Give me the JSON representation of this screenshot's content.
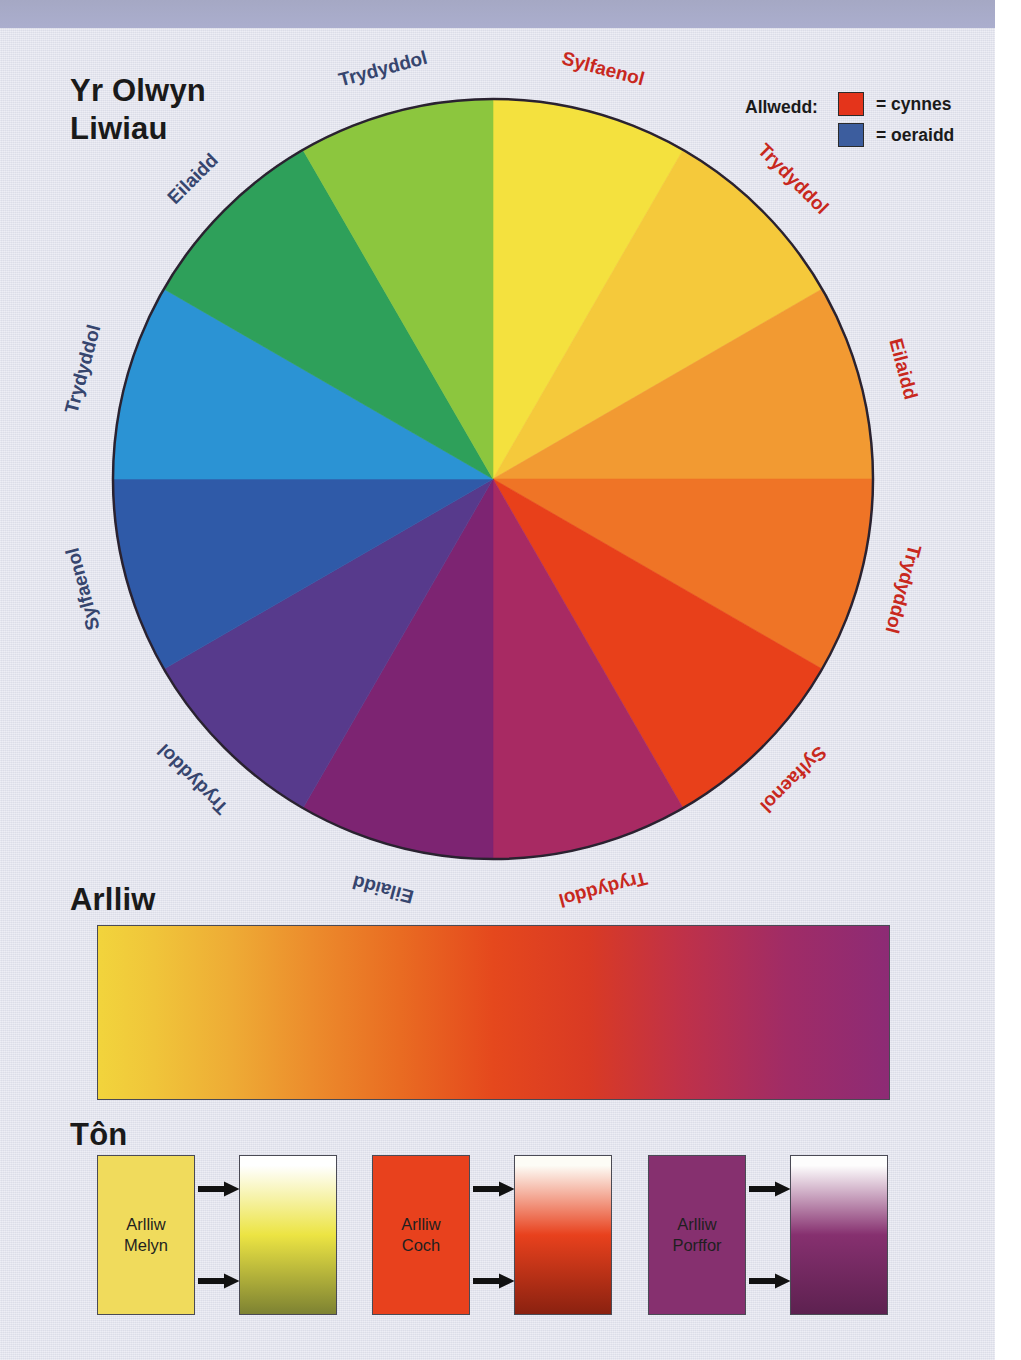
{
  "page": {
    "background": "#e2e3ee",
    "band_color": "#a8abc8"
  },
  "wheel": {
    "title_line1": "Yr Olwyn",
    "title_line2": "Liwiau",
    "segments": [
      {
        "label": "Sylfaenol",
        "name": "yellow",
        "color": "#f4e13e",
        "start_deg": 0,
        "end_deg": 30,
        "temp": "cynnes"
      },
      {
        "label": "Trydyddol",
        "name": "yellow-orange",
        "color": "#f5c93b",
        "start_deg": 30,
        "end_deg": 60,
        "temp": "cynnes"
      },
      {
        "label": "Eilaidd",
        "name": "orange",
        "color": "#f29a32",
        "start_deg": 60,
        "end_deg": 90,
        "temp": "cynnes"
      },
      {
        "label": "Trydyddol",
        "name": "red-orange",
        "color": "#ef7426",
        "start_deg": 90,
        "end_deg": 120,
        "temp": "cynnes"
      },
      {
        "label": "Sylfaenol",
        "name": "red",
        "color": "#e8401a",
        "start_deg": 120,
        "end_deg": 150,
        "temp": "cynnes"
      },
      {
        "label": "Trydyddol",
        "name": "red-violet",
        "color": "#a82a63",
        "start_deg": 150,
        "end_deg": 180,
        "temp": "cynnes"
      },
      {
        "label": "Eilaidd",
        "name": "violet",
        "color": "#7d2472",
        "start_deg": 180,
        "end_deg": 210,
        "temp": "oeraidd"
      },
      {
        "label": "Trydyddol",
        "name": "blue-violet",
        "color": "#573a8c",
        "start_deg": 210,
        "end_deg": 240,
        "temp": "oeraidd"
      },
      {
        "label": "Sylfaenol",
        "name": "blue",
        "color": "#2f5aa8",
        "start_deg": 240,
        "end_deg": 270,
        "temp": "oeraidd"
      },
      {
        "label": "Trydyddol",
        "name": "blue-green",
        "color": "#2b93d4",
        "start_deg": 270,
        "end_deg": 300,
        "temp": "oeraidd"
      },
      {
        "label": "Eilaidd",
        "name": "green",
        "color": "#2ea05a",
        "start_deg": 300,
        "end_deg": 330,
        "temp": "oeraidd"
      },
      {
        "label": "Trydyddol",
        "name": "yellow-green",
        "color": "#8cc63e",
        "start_deg": 330,
        "end_deg": 360,
        "temp": "oeraidd"
      }
    ],
    "label_colors": {
      "cynnes": "#c8281e",
      "oeraidd": "#36456e"
    }
  },
  "legend": {
    "title": "Allwedd:",
    "items": [
      {
        "swatch_color": "#e4341b",
        "text": "= cynnes"
      },
      {
        "swatch_color": "#3c5d9e",
        "text": "= oeraidd"
      }
    ]
  },
  "arlliw": {
    "title": "Arlliw",
    "gradient_stops": [
      "#f2d43c",
      "#ec8c2c",
      "#e5481d",
      "#bf3149",
      "#8d2b75"
    ]
  },
  "ton": {
    "title": "Tôn",
    "groups": [
      {
        "solid_color": "#f0db5c",
        "label_line1": "Arlliw",
        "label_line2": "Melyn",
        "grad_top": "#ffffff",
        "grad_mid": "#ece443",
        "grad_bottom": "#7d8232"
      },
      {
        "solid_color": "#e8411d",
        "label_line1": "Arlliw",
        "label_line2": "Coch",
        "grad_top": "#fdfcf6",
        "grad_mid": "#e8411d",
        "grad_bottom": "#8a2110"
      },
      {
        "solid_color": "#86306f",
        "label_line1": "Arlliw",
        "label_line2": "Porffor",
        "grad_top": "#fdfdfd",
        "grad_mid": "#86306f",
        "grad_bottom": "#5d2150"
      }
    ]
  }
}
